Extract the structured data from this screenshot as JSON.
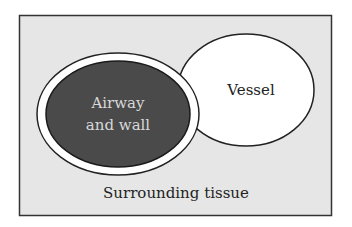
{
  "diagram": {
    "frame": {
      "label": "Surrounding tissue",
      "fill": "#e6e6e6",
      "stroke": "#333333"
    },
    "airway": {
      "label_line1": "Airway",
      "label_line2": "and wall",
      "fill": "#4a4a4a",
      "text_color": "#d8d8d8"
    },
    "vessel": {
      "label": "Vessel",
      "fill": "#ffffff"
    }
  }
}
